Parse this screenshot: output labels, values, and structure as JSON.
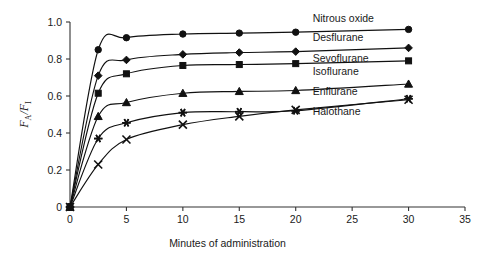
{
  "chart_data": {
    "type": "line",
    "title": "",
    "subtitle": "",
    "xlabel": "Minutes of administration",
    "ylabel": "FA/FI",
    "ylabel_parts": {
      "numerator": "F",
      "numerator_sub": "A",
      "slash": "/",
      "denominator": "F",
      "denominator_sub": "I"
    },
    "xlim": [
      0,
      35
    ],
    "ylim": [
      0,
      1.0
    ],
    "xticks": [
      0,
      5,
      10,
      15,
      20,
      25,
      30,
      35
    ],
    "xtick_labels": [
      "0",
      "5",
      "10",
      "15",
      "20",
      "25",
      "30",
      "35"
    ],
    "yticks": [
      0,
      0.2,
      0.4,
      0.6,
      0.8,
      1.0
    ],
    "ytick_labels": [
      "0",
      "0.2",
      "0.4",
      "0.6",
      "0.8",
      "1.0"
    ],
    "grid": false,
    "legend_position": "inline-right",
    "x": [
      0,
      2.5,
      5,
      10,
      15,
      20,
      30
    ],
    "series": [
      {
        "name": "Nitrous oxide",
        "marker": "circle",
        "values": [
          0,
          0.85,
          0.915,
          0.935,
          0.94,
          0.945,
          0.96
        ],
        "label_x": 21.5,
        "label_y": 1.0
      },
      {
        "name": "Desflurane",
        "marker": "diamond",
        "values": [
          0,
          0.71,
          0.795,
          0.825,
          0.835,
          0.84,
          0.86
        ],
        "label_x": 21.5,
        "label_y": 0.9
      },
      {
        "name": "Sevoflurane",
        "marker": "square",
        "values": [
          0,
          0.615,
          0.72,
          0.765,
          0.77,
          0.775,
          0.79
        ],
        "label_x": 21.5,
        "label_y": 0.785
      },
      {
        "name": "Isoflurane",
        "marker": "triangle",
        "values": [
          0,
          0.49,
          0.565,
          0.615,
          0.625,
          0.63,
          0.665
        ],
        "label_x": 21.5,
        "label_y": 0.715
      },
      {
        "name": "Enflurane",
        "marker": "asterisk",
        "values": [
          0,
          0.37,
          0.455,
          0.51,
          0.515,
          0.52,
          0.585
        ],
        "label_x": 21.5,
        "label_y": 0.605
      },
      {
        "name": "Halothane",
        "marker": "cross",
        "values": [
          0,
          0.23,
          0.365,
          0.445,
          0.49,
          0.525,
          0.58
        ],
        "label_x": 21.5,
        "label_y": 0.5
      }
    ],
    "colors": {
      "axis": "#333333",
      "line": "#111111",
      "marker": "#111111",
      "text": "#1a1a1a",
      "background": "#ffffff"
    }
  }
}
